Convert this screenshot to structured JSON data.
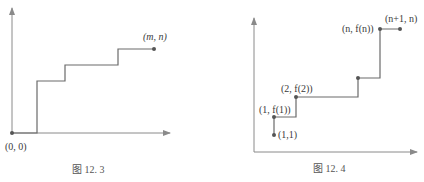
{
  "figure_3": {
    "caption": "图 12. 3",
    "origin_label": "(0, 0)",
    "end_label": "(m, n)",
    "origin": [
      12,
      133
    ],
    "end": [
      154,
      49
    ],
    "path": [
      [
        12,
        133
      ],
      [
        37,
        133
      ],
      [
        37,
        81
      ],
      [
        65,
        81
      ],
      [
        65,
        65
      ],
      [
        118,
        65
      ],
      [
        118,
        49
      ],
      [
        154,
        49
      ]
    ]
  },
  "figure_4": {
    "caption": "图 12. 4",
    "labels": {
      "p11": "(1,1)",
      "p1f1": "(1, f(1))",
      "p2f2": "(2, f(2))",
      "pnfn": "(n, f(n))",
      "pn1n": "(n+1, n)"
    },
    "points": [
      [
        274,
        135
      ],
      [
        274,
        117
      ],
      [
        296,
        97
      ],
      [
        358,
        78
      ],
      [
        380,
        29
      ],
      [
        400,
        29
      ]
    ],
    "path": [
      [
        274,
        135
      ],
      [
        274,
        117
      ],
      [
        296,
        117
      ],
      [
        296,
        97
      ],
      [
        358,
        97
      ],
      [
        358,
        78
      ],
      [
        380,
        78
      ],
      [
        380,
        29
      ],
      [
        400,
        29
      ]
    ]
  },
  "colors": {
    "axis": "#8a8a8a",
    "line": "#6a6a6a",
    "point": "#555555",
    "text": "#3a3a3a"
  }
}
